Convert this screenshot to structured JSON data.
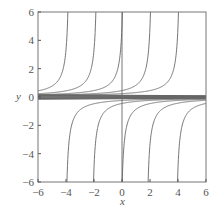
{
  "chart_data": {
    "type": "line",
    "title": "",
    "xlabel": "x",
    "ylabel": "y",
    "xlim": [
      -6,
      6
    ],
    "ylim": [
      -6,
      6
    ],
    "xticks": [
      "-6",
      "-4",
      "-2",
      "0",
      "2",
      "4",
      "6"
    ],
    "yticks": [
      "-6",
      "-4",
      "-2",
      "0",
      "2",
      "4",
      "6"
    ],
    "grid": false,
    "legend": null,
    "upper_branch_asymptotes": [
      -3.7,
      -1.7,
      0.2,
      2.2,
      4.2
    ],
    "lower_branch_asymptotes": [
      -4.1,
      -2.2,
      -0.15,
      1.7,
      3.8
    ],
    "vertical_line_x": 0,
    "near_zero_curves_offsets": [
      -0.15,
      -0.1,
      -0.05,
      0,
      0.05,
      0.1,
      0.15
    ]
  },
  "colors": {
    "curve": "#666666",
    "axis": "#555555",
    "text": "#555555"
  },
  "labels": {
    "x": "x",
    "y": "y"
  }
}
